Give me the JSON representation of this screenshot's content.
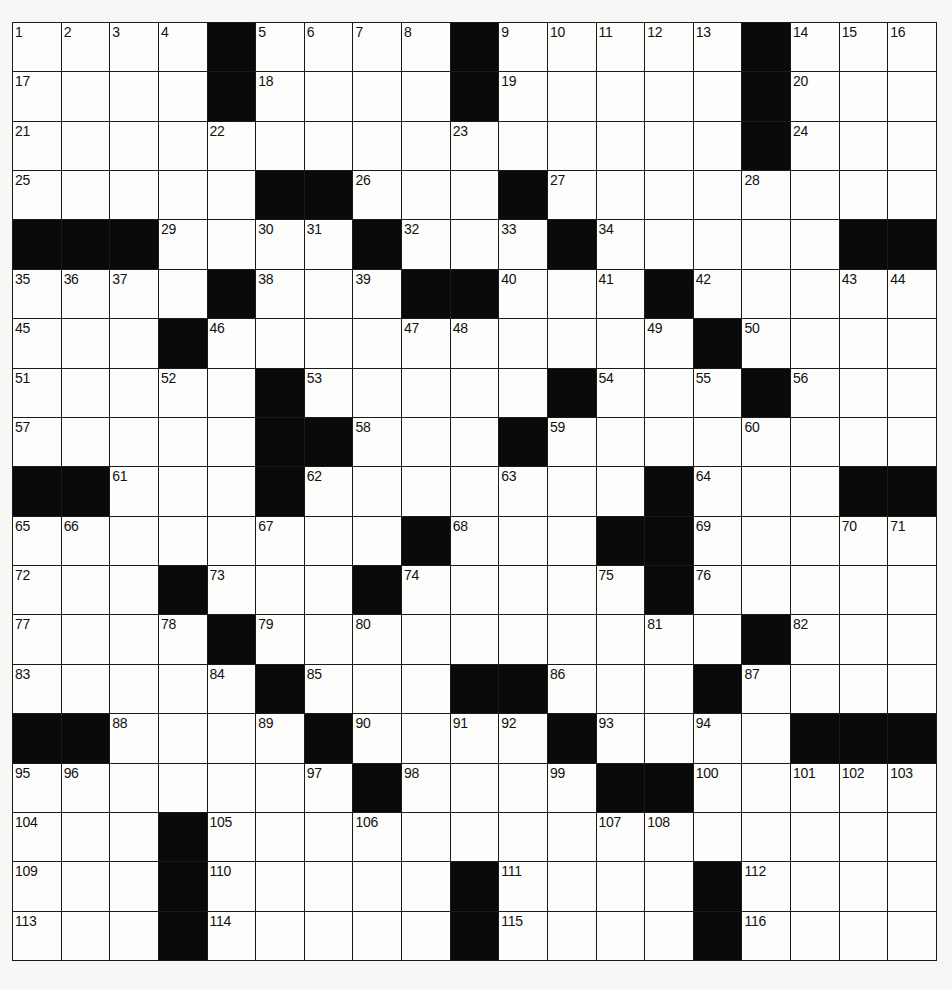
{
  "puzzle": {
    "rows": 19,
    "cols": 19,
    "colors": {
      "block": "#0a0a0a",
      "cell": "#fdfdfb",
      "line": "#1a1a1a"
    },
    "grid": [
      "....#....#.....#...",
      "....#....#.....#...",
      ".........+.....#...",
      ".....##...#........",
      "###.....#...#.....##",
      "....#...##...#.....",
      "...#.........#.....",
      ".....#.....#...#...",
      ".....##...#........",
      "##....#.......#...##",
      "........#...##.....",
      "...#...#.....#.....",
      "....#..........#...",
      ".....#...##...#....",
      "##.....#...#....###",
      ".......#....##.....",
      "...#...............",
      "...#.....#....#....",
      "...#.....#....#...."
    ],
    "numbers": [
      {
        "r": 0,
        "c": 0,
        "n": "1"
      },
      {
        "r": 0,
        "c": 1,
        "n": "2"
      },
      {
        "r": 0,
        "c": 2,
        "n": "3"
      },
      {
        "r": 0,
        "c": 3,
        "n": "4"
      },
      {
        "r": 0,
        "c": 5,
        "n": "5"
      },
      {
        "r": 0,
        "c": 6,
        "n": "6"
      },
      {
        "r": 0,
        "c": 7,
        "n": "7"
      },
      {
        "r": 0,
        "c": 8,
        "n": "8"
      },
      {
        "r": 0,
        "c": 10,
        "n": "9"
      },
      {
        "r": 0,
        "c": 11,
        "n": "10"
      },
      {
        "r": 0,
        "c": 12,
        "n": "11"
      },
      {
        "r": 0,
        "c": 13,
        "n": "12"
      },
      {
        "r": 0,
        "c": 14,
        "n": "13"
      },
      {
        "r": 0,
        "c": 16,
        "n": "14"
      },
      {
        "r": 0,
        "c": 17,
        "n": "15"
      },
      {
        "r": 0,
        "c": 18,
        "n": "16"
      },
      {
        "r": 1,
        "c": 0,
        "n": "17"
      },
      {
        "r": 1,
        "c": 5,
        "n": "18"
      },
      {
        "r": 1,
        "c": 10,
        "n": "19"
      },
      {
        "r": 1,
        "c": 16,
        "n": "20"
      },
      {
        "r": 2,
        "c": 0,
        "n": "21"
      },
      {
        "r": 2,
        "c": 4,
        "n": "22"
      },
      {
        "r": 2,
        "c": 9,
        "n": "23"
      },
      {
        "r": 2,
        "c": 16,
        "n": "24"
      },
      {
        "r": 3,
        "c": 0,
        "n": "25"
      },
      {
        "r": 3,
        "c": 7,
        "n": "26"
      },
      {
        "r": 3,
        "c": 11,
        "n": "27"
      },
      {
        "r": 3,
        "c": 15,
        "n": "28"
      },
      {
        "r": 4,
        "c": 3,
        "n": "29"
      },
      {
        "r": 4,
        "c": 5,
        "n": "30"
      },
      {
        "r": 4,
        "c": 6,
        "n": "31"
      },
      {
        "r": 4,
        "c": 8,
        "n": "32"
      },
      {
        "r": 4,
        "c": 10,
        "n": "33"
      },
      {
        "r": 4,
        "c": 12,
        "n": "34"
      },
      {
        "r": 5,
        "c": 0,
        "n": "35"
      },
      {
        "r": 5,
        "c": 1,
        "n": "36"
      },
      {
        "r": 5,
        "c": 2,
        "n": "37"
      },
      {
        "r": 5,
        "c": 5,
        "n": "38"
      },
      {
        "r": 5,
        "c": 7,
        "n": "39"
      },
      {
        "r": 5,
        "c": 10,
        "n": "40"
      },
      {
        "r": 5,
        "c": 12,
        "n": "41"
      },
      {
        "r": 5,
        "c": 14,
        "n": "42"
      },
      {
        "r": 5,
        "c": 17,
        "n": "43"
      },
      {
        "r": 5,
        "c": 18,
        "n": "44"
      },
      {
        "r": 6,
        "c": 0,
        "n": "45"
      },
      {
        "r": 6,
        "c": 4,
        "n": "46"
      },
      {
        "r": 6,
        "c": 8,
        "n": "47"
      },
      {
        "r": 6,
        "c": 9,
        "n": "48"
      },
      {
        "r": 6,
        "c": 13,
        "n": "49"
      },
      {
        "r": 6,
        "c": 15,
        "n": "50"
      },
      {
        "r": 7,
        "c": 0,
        "n": "51"
      },
      {
        "r": 7,
        "c": 3,
        "n": "52"
      },
      {
        "r": 7,
        "c": 6,
        "n": "53"
      },
      {
        "r": 7,
        "c": 12,
        "n": "54"
      },
      {
        "r": 7,
        "c": 14,
        "n": "55"
      },
      {
        "r": 7,
        "c": 16,
        "n": "56"
      },
      {
        "r": 8,
        "c": 0,
        "n": "57"
      },
      {
        "r": 8,
        "c": 7,
        "n": "58"
      },
      {
        "r": 8,
        "c": 11,
        "n": "59"
      },
      {
        "r": 8,
        "c": 15,
        "n": "60"
      },
      {
        "r": 9,
        "c": 2,
        "n": "61"
      },
      {
        "r": 9,
        "c": 6,
        "n": "62"
      },
      {
        "r": 9,
        "c": 10,
        "n": "63"
      },
      {
        "r": 9,
        "c": 14,
        "n": "64"
      },
      {
        "r": 10,
        "c": 0,
        "n": "65"
      },
      {
        "r": 10,
        "c": 1,
        "n": "66"
      },
      {
        "r": 10,
        "c": 5,
        "n": "67"
      },
      {
        "r": 10,
        "c": 9,
        "n": "68"
      },
      {
        "r": 10,
        "c": 14,
        "n": "69"
      },
      {
        "r": 10,
        "c": 17,
        "n": "70"
      },
      {
        "r": 10,
        "c": 18,
        "n": "71"
      },
      {
        "r": 11,
        "c": 0,
        "n": "72"
      },
      {
        "r": 11,
        "c": 4,
        "n": "73"
      },
      {
        "r": 11,
        "c": 8,
        "n": "74"
      },
      {
        "r": 11,
        "c": 12,
        "n": "75"
      },
      {
        "r": 11,
        "c": 14,
        "n": "76"
      },
      {
        "r": 12,
        "c": 0,
        "n": "77"
      },
      {
        "r": 12,
        "c": 3,
        "n": "78"
      },
      {
        "r": 12,
        "c": 5,
        "n": "79"
      },
      {
        "r": 12,
        "c": 7,
        "n": "80"
      },
      {
        "r": 12,
        "c": 13,
        "n": "81"
      },
      {
        "r": 12,
        "c": 16,
        "n": "82"
      },
      {
        "r": 13,
        "c": 0,
        "n": "83"
      },
      {
        "r": 13,
        "c": 4,
        "n": "84"
      },
      {
        "r": 13,
        "c": 6,
        "n": "85"
      },
      {
        "r": 13,
        "c": 11,
        "n": "86"
      },
      {
        "r": 13,
        "c": 15,
        "n": "87"
      },
      {
        "r": 14,
        "c": 2,
        "n": "88"
      },
      {
        "r": 14,
        "c": 5,
        "n": "89"
      },
      {
        "r": 14,
        "c": 7,
        "n": "90"
      },
      {
        "r": 14,
        "c": 9,
        "n": "91"
      },
      {
        "r": 14,
        "c": 10,
        "n": "92"
      },
      {
        "r": 14,
        "c": 12,
        "n": "93"
      },
      {
        "r": 14,
        "c": 14,
        "n": "94"
      },
      {
        "r": 15,
        "c": 0,
        "n": "95"
      },
      {
        "r": 15,
        "c": 1,
        "n": "96"
      },
      {
        "r": 15,
        "c": 6,
        "n": "97"
      },
      {
        "r": 15,
        "c": 8,
        "n": "98"
      },
      {
        "r": 15,
        "c": 11,
        "n": "99"
      },
      {
        "r": 15,
        "c": 14,
        "n": "100"
      },
      {
        "r": 15,
        "c": 16,
        "n": "101"
      },
      {
        "r": 15,
        "c": 17,
        "n": "102"
      },
      {
        "r": 15,
        "c": 18,
        "n": "103"
      },
      {
        "r": 16,
        "c": 0,
        "n": "104"
      },
      {
        "r": 16,
        "c": 4,
        "n": "105"
      },
      {
        "r": 16,
        "c": 7,
        "n": "106"
      },
      {
        "r": 16,
        "c": 12,
        "n": "107"
      },
      {
        "r": 16,
        "c": 13,
        "n": "108"
      },
      {
        "r": 17,
        "c": 0,
        "n": "109"
      },
      {
        "r": 17,
        "c": 4,
        "n": "110"
      },
      {
        "r": 17,
        "c": 10,
        "n": "111"
      },
      {
        "r": 17,
        "c": 15,
        "n": "112"
      },
      {
        "r": 18,
        "c": 0,
        "n": "113"
      },
      {
        "r": 18,
        "c": 4,
        "n": "114"
      },
      {
        "r": 18,
        "c": 10,
        "n": "115"
      },
      {
        "r": 18,
        "c": 15,
        "n": "116"
      }
    ]
  }
}
